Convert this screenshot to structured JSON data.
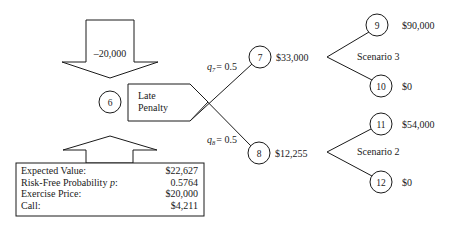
{
  "top_arrow": {
    "label": "–20,000"
  },
  "root_node": {
    "id": "6"
  },
  "event_box": {
    "line1": "Late",
    "line2": "Penalty"
  },
  "branches": [
    {
      "prob_var": "q",
      "prob_sub": "7",
      "prob_value": "= 0.5",
      "node": "7",
      "value": "$33,000"
    },
    {
      "prob_var": "q",
      "prob_sub": "8",
      "prob_value": "= 0.5",
      "node": "8",
      "value": "$12,255"
    }
  ],
  "scenarios": [
    {
      "label": "Scenario 3",
      "upper": {
        "node": "9",
        "value": "$90,000"
      },
      "lower": {
        "node": "10",
        "value": "$0"
      }
    },
    {
      "label": "Scenario 2",
      "upper": {
        "node": "11",
        "value": "$54,000"
      },
      "lower": {
        "node": "12",
        "value": "$0"
      }
    }
  ],
  "summary_box": {
    "rows": [
      {
        "label": "Expected Value:",
        "value": "$22,627"
      },
      {
        "label": "Risk-Free Probability ",
        "label_ital": "p",
        "label_tail": ":",
        "value": "0.5764"
      },
      {
        "label": "Exercise Price:",
        "value": "$20,000"
      },
      {
        "label": "Call:",
        "value": "$4,211"
      }
    ]
  }
}
